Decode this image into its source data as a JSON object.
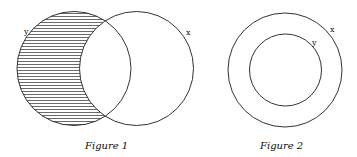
{
  "figures": [
    {
      "caption": "Figure 1",
      "sets": [
        {
          "label": "y",
          "cx": 74,
          "cy": 68.5,
          "r": 57,
          "shaded": "difference y - x"
        },
        {
          "label": "x",
          "cx": 136.5,
          "cy": 68.5,
          "r": 57
        }
      ]
    },
    {
      "caption": "Figure 2",
      "sets": [
        {
          "label": "x",
          "cx": 285,
          "cy": 70,
          "r": 57
        },
        {
          "label": "y",
          "cx": 285.5,
          "cy": 70,
          "r": 36
        }
      ]
    }
  ],
  "colors": {
    "stroke": "#333333",
    "hatch": "#444444",
    "background": "#ffffff"
  }
}
